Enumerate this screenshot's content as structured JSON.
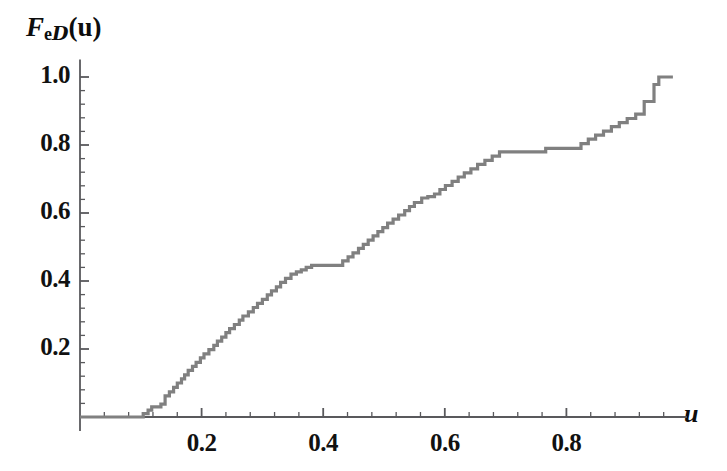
{
  "chart_data": {
    "type": "line",
    "subtype": "empirical-cdf-step",
    "title": "",
    "ylabel": "F_eD(u)",
    "ylabel_parts": {
      "base": "F",
      "sub_e": "e",
      "sub_d": "D",
      "arg": "(u)"
    },
    "xlabel": "u",
    "xlim": [
      0.0,
      0.985
    ],
    "ylim": [
      0.0,
      1.04
    ],
    "xticks": [
      0.2,
      0.4,
      0.6,
      0.8
    ],
    "xtick_labels": [
      "0.2",
      "0.4",
      "0.6",
      "0.8"
    ],
    "yticks": [
      0.2,
      0.4,
      0.6,
      0.8,
      1.0
    ],
    "ytick_labels": [
      "0.2",
      "0.4",
      "0.6",
      "0.8",
      "1.0"
    ],
    "minor_ticks_per_interval": 4,
    "grid": false,
    "legend": null,
    "series_color": "#808080",
    "axis_color": "#59595c",
    "x": [
      0.0,
      0.098,
      0.104,
      0.112,
      0.118,
      0.133,
      0.14,
      0.147,
      0.154,
      0.16,
      0.167,
      0.172,
      0.178,
      0.185,
      0.191,
      0.198,
      0.204,
      0.212,
      0.22,
      0.226,
      0.233,
      0.24,
      0.246,
      0.254,
      0.262,
      0.268,
      0.277,
      0.285,
      0.292,
      0.3,
      0.308,
      0.315,
      0.323,
      0.33,
      0.338,
      0.347,
      0.356,
      0.364,
      0.372,
      0.381,
      0.424,
      0.432,
      0.441,
      0.449,
      0.458,
      0.466,
      0.474,
      0.482,
      0.49,
      0.498,
      0.506,
      0.515,
      0.524,
      0.534,
      0.542,
      0.55,
      0.562,
      0.572,
      0.583,
      0.592,
      0.601,
      0.612,
      0.622,
      0.632,
      0.643,
      0.654,
      0.666,
      0.678,
      0.69,
      0.702,
      0.714,
      0.726,
      0.739,
      0.752,
      0.766,
      0.812,
      0.824,
      0.836,
      0.848,
      0.861,
      0.874,
      0.887,
      0.9,
      0.914,
      0.928,
      0.944,
      0.952
    ],
    "y": [
      0.0,
      0.0,
      0.01,
      0.02,
      0.03,
      0.038,
      0.062,
      0.074,
      0.087,
      0.1,
      0.112,
      0.124,
      0.137,
      0.149,
      0.161,
      0.174,
      0.186,
      0.198,
      0.211,
      0.223,
      0.235,
      0.248,
      0.26,
      0.272,
      0.285,
      0.297,
      0.309,
      0.322,
      0.334,
      0.346,
      0.359,
      0.371,
      0.383,
      0.396,
      0.408,
      0.42,
      0.427,
      0.433,
      0.44,
      0.446,
      0.446,
      0.459,
      0.471,
      0.483,
      0.496,
      0.508,
      0.52,
      0.533,
      0.545,
      0.557,
      0.57,
      0.582,
      0.594,
      0.607,
      0.619,
      0.631,
      0.644,
      0.648,
      0.656,
      0.669,
      0.681,
      0.693,
      0.706,
      0.718,
      0.73,
      0.743,
      0.755,
      0.767,
      0.78,
      0.78,
      0.78,
      0.78,
      0.78,
      0.78,
      0.79,
      0.79,
      0.804,
      0.817,
      0.829,
      0.841,
      0.854,
      0.866,
      0.878,
      0.891,
      0.928,
      0.978,
      1.0
    ]
  }
}
